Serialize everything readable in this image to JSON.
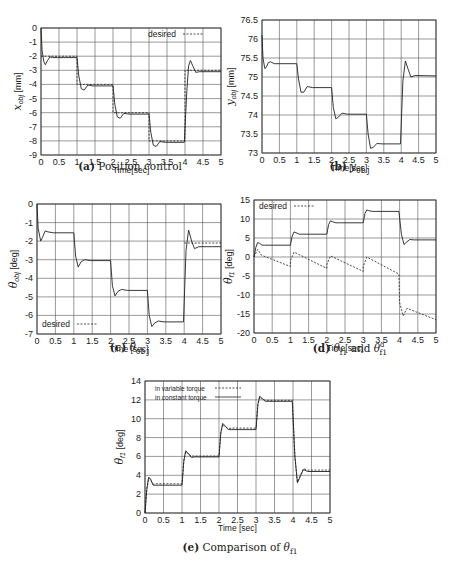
{
  "chart_data": [
    {
      "id": "a",
      "type": "line",
      "caption_label": "(a)",
      "caption_text": "Position control",
      "xlabel": "Time[sec]",
      "ylabel": "x_obj [mm]",
      "ylabel_main": "x",
      "ylabel_sub": "obj",
      "ylabel_unit": " [mm]",
      "xlim": [
        0,
        5
      ],
      "ylim": [
        -9,
        0
      ],
      "xticks": [
        0,
        0.5,
        1,
        1.5,
        2,
        2.5,
        3,
        3.5,
        4,
        4.5,
        5
      ],
      "yticks": [
        0,
        -1,
        -2,
        -3,
        -4,
        -5,
        -6,
        -7,
        -8,
        -9
      ],
      "grid": true,
      "legend": [
        {
          "label": "desired",
          "style": "dashed"
        }
      ],
      "legend_position": "top-right",
      "frame": {
        "x": 41,
        "y": 28,
        "w": 180,
        "h": 127
      },
      "series": [
        {
          "name": "actual",
          "style": "solid",
          "x": [
            0,
            0.03,
            0.08,
            0.12,
            0.18,
            0.25,
            0.32,
            0.45,
            1.0,
            1.05,
            1.12,
            1.2,
            1.3,
            1.45,
            2.0,
            2.05,
            2.12,
            2.2,
            2.3,
            2.45,
            3.0,
            3.05,
            3.12,
            3.2,
            3.3,
            3.45,
            3.98,
            4.05,
            4.1,
            4.15,
            4.22,
            4.3,
            4.4,
            5.0
          ],
          "y": [
            0,
            -1.6,
            -2.4,
            -2.6,
            -2.3,
            -2.05,
            -2.1,
            -2.1,
            -2.1,
            -3.4,
            -4.3,
            -4.4,
            -4.05,
            -4.1,
            -4.1,
            -5.4,
            -6.3,
            -6.4,
            -6.05,
            -6.1,
            -6.1,
            -7.4,
            -8.3,
            -8.4,
            -8.05,
            -8.1,
            -8.1,
            -4.5,
            -2.7,
            -2.3,
            -2.7,
            -3.15,
            -3.1,
            -3.1
          ]
        },
        {
          "name": "desired",
          "style": "dashed",
          "x": [
            0,
            1,
            1,
            2,
            2,
            3,
            3,
            4,
            4,
            5
          ],
          "y": [
            -2,
            -2,
            -4,
            -4,
            -6,
            -6,
            -8,
            -8,
            -3,
            -3
          ]
        }
      ]
    },
    {
      "id": "b",
      "type": "line",
      "caption_label": "(b)",
      "caption_text": "y_obj",
      "caption_main": "y",
      "caption_sub": "obj",
      "xlabel": "Time[sec]",
      "ylabel": "y_obj [mm]",
      "ylabel_main": "y",
      "ylabel_sub": "obj",
      "ylabel_unit": " [mm]",
      "xlim": [
        0,
        5
      ],
      "ylim": [
        73,
        76.5
      ],
      "xticks": [
        0,
        0.5,
        1,
        1.5,
        2,
        2.5,
        3,
        3.5,
        4,
        4.5,
        5
      ],
      "yticks": [
        76.5,
        76,
        75.5,
        75,
        74.5,
        74,
        73.5,
        73
      ],
      "grid": true,
      "legend": [],
      "frame": {
        "x": 262,
        "y": 20,
        "w": 174,
        "h": 133
      },
      "series": [
        {
          "name": "actual",
          "style": "solid",
          "x": [
            0,
            0.03,
            0.08,
            0.12,
            0.18,
            0.25,
            0.35,
            1.0,
            1.05,
            1.12,
            1.2,
            1.3,
            1.45,
            2.0,
            2.05,
            2.12,
            2.2,
            2.3,
            2.45,
            3.0,
            3.05,
            3.12,
            3.2,
            3.3,
            3.45,
            3.98,
            4.05,
            4.12,
            4.2,
            4.28,
            4.4,
            5.0
          ],
          "y": [
            76.1,
            75.5,
            75.22,
            75.25,
            75.38,
            75.4,
            75.35,
            75.35,
            74.95,
            74.6,
            74.6,
            74.75,
            74.72,
            74.72,
            74.2,
            73.9,
            73.95,
            74.05,
            74.02,
            74.02,
            73.5,
            73.12,
            73.15,
            73.25,
            73.24,
            73.24,
            74.9,
            75.42,
            75.2,
            75.0,
            75.04,
            75.03
          ]
        }
      ]
    },
    {
      "id": "c",
      "type": "line",
      "caption_label": "(c)",
      "caption_text": "θ_obj",
      "caption_main": "θ",
      "caption_sub": "obj",
      "xlabel": "Time [sec]",
      "ylabel": "θ_obj [deg]",
      "ylabel_main": "θ",
      "ylabel_sub": "obj",
      "ylabel_unit": " [deg]",
      "xlim": [
        0,
        5
      ],
      "ylim": [
        -7,
        0
      ],
      "xticks": [
        0,
        0.5,
        1,
        1.5,
        2,
        2.5,
        3,
        3.5,
        4,
        4.5,
        5
      ],
      "yticks": [
        0,
        -1,
        -2,
        -3,
        -4,
        -5,
        -6,
        -7
      ],
      "grid": true,
      "legend": [
        {
          "label": "desired",
          "style": "dashed"
        }
      ],
      "legend_position": "bottom-left",
      "frame": {
        "x": 37,
        "y": 204,
        "w": 184,
        "h": 130
      },
      "series": [
        {
          "name": "actual",
          "style": "solid",
          "x": [
            0,
            0.03,
            0.1,
            0.15,
            0.22,
            0.3,
            0.45,
            1.0,
            1.05,
            1.12,
            1.2,
            1.3,
            1.45,
            2.0,
            2.05,
            2.12,
            2.2,
            2.3,
            2.45,
            3.0,
            3.05,
            3.12,
            3.2,
            3.3,
            3.45,
            3.98,
            4.05,
            4.12,
            4.2,
            4.28,
            4.4,
            5.0
          ],
          "y": [
            0,
            -1.3,
            -2.0,
            -1.8,
            -1.45,
            -1.5,
            -1.55,
            -1.55,
            -2.8,
            -3.4,
            -3.1,
            -3.0,
            -3.05,
            -3.05,
            -4.4,
            -4.95,
            -4.7,
            -4.6,
            -4.65,
            -4.65,
            -6.0,
            -6.6,
            -6.4,
            -6.3,
            -6.35,
            -6.35,
            -2.5,
            -1.4,
            -2.0,
            -2.4,
            -2.3,
            -2.3
          ]
        },
        {
          "name": "desired",
          "style": "dashed",
          "x": [
            4,
            5
          ],
          "y": [
            -2.1,
            -2.1
          ]
        }
      ]
    },
    {
      "id": "d",
      "type": "line",
      "caption_label": "(d)",
      "caption_text": "θ_f1 and θ_f1^d",
      "xlabel": "Time[sec]",
      "ylabel": "θ_f1 [deg]",
      "ylabel_main": "θ",
      "ylabel_sub": "f1",
      "ylabel_unit": " [deg]",
      "xlim": [
        0,
        5
      ],
      "ylim": [
        -20,
        15
      ],
      "xticks": [
        0,
        0.5,
        1,
        1.5,
        2,
        2.5,
        3,
        3.5,
        4,
        4.5,
        5
      ],
      "yticks": [
        15,
        10,
        5,
        0,
        -5,
        -10,
        -15,
        -20
      ],
      "grid": true,
      "legend": [
        {
          "label": "desired",
          "style": "dashed"
        }
      ],
      "legend_position": "top-left",
      "frame": {
        "x": 254,
        "y": 200,
        "w": 182,
        "h": 133
      },
      "series": [
        {
          "name": "actual",
          "style": "solid",
          "x": [
            0,
            0.05,
            0.1,
            0.15,
            0.22,
            0.3,
            1.0,
            1.05,
            1.1,
            1.15,
            1.25,
            1.35,
            2.0,
            2.05,
            2.1,
            2.15,
            2.25,
            2.35,
            3.0,
            3.05,
            3.1,
            3.15,
            3.25,
            3.35,
            3.98,
            4.05,
            4.12,
            4.2,
            4.28,
            4.4,
            5.0
          ],
          "y": [
            0,
            2.5,
            3.8,
            3.6,
            3.1,
            3.1,
            3.1,
            5.5,
            6.6,
            6.4,
            6.0,
            6.0,
            6.0,
            8.5,
            9.5,
            9.3,
            9.0,
            9.0,
            9.0,
            11.5,
            12.4,
            12.2,
            12.0,
            12.0,
            12.0,
            6.0,
            3.3,
            4.0,
            4.6,
            4.5,
            4.5
          ]
        },
        {
          "name": "desired",
          "style": "dashed",
          "x": [
            0,
            0.1,
            0.2,
            1.0,
            1.0,
            1.1,
            2.0,
            2.0,
            2.1,
            3.0,
            3.0,
            3.1,
            3.98,
            4.0,
            4.1,
            4.2,
            5.0
          ],
          "y": [
            0,
            2.0,
            0.5,
            -2.5,
            -1.0,
            1.3,
            -3.0,
            -2.0,
            0.3,
            -3.8,
            -2.5,
            0.0,
            -4.5,
            -12.0,
            -15.5,
            -13.5,
            -16.5
          ]
        }
      ]
    },
    {
      "id": "e",
      "type": "line",
      "caption_label": "(e)",
      "caption_text": "Comparison of θ_f1",
      "xlabel": "Time [sec]",
      "ylabel": "θ_f1 [deg]",
      "ylabel_main": "θ",
      "ylabel_sub": "f1",
      "ylabel_unit": " [deg]",
      "xlim": [
        0,
        5
      ],
      "ylim": [
        0,
        14
      ],
      "xticks": [
        0,
        0.5,
        1,
        1.5,
        2,
        2.5,
        3,
        3.5,
        4,
        4.5,
        5
      ],
      "yticks": [
        14,
        12,
        10,
        8,
        6,
        4,
        2,
        0
      ],
      "grid": true,
      "legend": [
        {
          "label": "in variable torque",
          "style": "dashed"
        },
        {
          "label": "in constant torque",
          "style": "solid"
        }
      ],
      "legend_position": "top-left",
      "frame": {
        "x": 145,
        "y": 381,
        "w": 185,
        "h": 132
      },
      "series": [
        {
          "name": "in variable torque",
          "style": "dashed",
          "x": [
            0,
            0.05,
            0.1,
            0.15,
            0.22,
            0.3,
            1.0,
            1.05,
            1.1,
            1.15,
            1.25,
            1.35,
            2.0,
            2.05,
            2.1,
            2.15,
            2.25,
            2.35,
            3.0,
            3.05,
            3.1,
            3.15,
            3.25,
            3.35,
            3.98,
            4.05,
            4.12,
            4.2,
            4.28,
            4.4,
            5.0
          ],
          "y": [
            0,
            2.5,
            3.7,
            3.5,
            3.05,
            3.1,
            3.1,
            5.5,
            6.5,
            6.3,
            6.05,
            6.05,
            6.05,
            8.5,
            9.4,
            9.2,
            8.95,
            9.0,
            9.0,
            11.5,
            12.3,
            12.1,
            11.95,
            11.95,
            11.95,
            6.0,
            3.3,
            4.0,
            4.7,
            4.55,
            4.55
          ]
        },
        {
          "name": "in constant torque",
          "style": "solid",
          "x": [
            0,
            0.05,
            0.1,
            0.15,
            0.22,
            0.3,
            1.0,
            1.05,
            1.1,
            1.15,
            1.25,
            1.35,
            2.0,
            2.05,
            2.1,
            2.15,
            2.25,
            2.35,
            3.0,
            3.05,
            3.1,
            3.15,
            3.25,
            3.35,
            3.98,
            4.05,
            4.12,
            4.2,
            4.28,
            4.4,
            5.0
          ],
          "y": [
            0,
            2.5,
            3.8,
            3.6,
            2.95,
            2.95,
            2.95,
            5.5,
            6.6,
            6.4,
            5.9,
            5.95,
            5.95,
            8.5,
            9.5,
            9.3,
            8.85,
            8.85,
            8.85,
            11.5,
            12.4,
            12.2,
            11.85,
            11.85,
            11.85,
            6.0,
            3.2,
            3.9,
            4.6,
            4.4,
            4.4
          ]
        }
      ]
    }
  ],
  "captions": {
    "a": {
      "label": "(a)",
      "text": "Position control"
    },
    "b": {
      "label": "(b)",
      "main": "y",
      "sub": "obj"
    },
    "c": {
      "label": "(c)",
      "main": "θ",
      "sub": "obj"
    },
    "d": {
      "label": "(d)",
      "main": "θ",
      "sub": "f1",
      "joiner": " and ",
      "main2": "θ",
      "sub2": "f1",
      "sup2": "d"
    },
    "e": {
      "label": "(e)",
      "text": "Comparison of ",
      "main": "θ",
      "sub": "f1"
    }
  }
}
